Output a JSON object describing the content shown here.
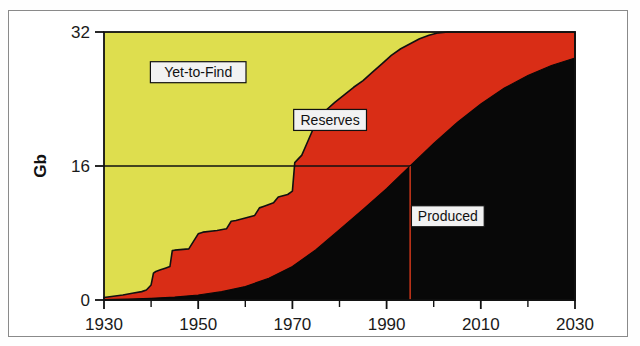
{
  "figure": {
    "background": "#ffffff",
    "frame_color": "#8a8a8a"
  },
  "chart_data": {
    "type": "area",
    "title": "",
    "subtitle": "",
    "xlabel": "",
    "ylabel": "Gb",
    "xlim": [
      1930,
      2030
    ],
    "ylim": [
      0,
      32
    ],
    "grid": false,
    "legend_position": "inline-annotations",
    "stacking": "cumulative-bands",
    "xticks": [
      1930,
      1950,
      1970,
      1990,
      2010,
      2030
    ],
    "xtick_labels": [
      "1930",
      "1950",
      "1970",
      "1990",
      "2010",
      "2030"
    ],
    "xminor_ticks": [
      1940,
      1960,
      1980,
      2000,
      2020
    ],
    "yticks": [
      0,
      16,
      32
    ],
    "ytick_labels": [
      "0",
      "16",
      "32"
    ],
    "series": [
      {
        "name": "Produced",
        "color": "#080808",
        "label": "Produced",
        "role": "cumulative-production",
        "x": [
          1930,
          1935,
          1940,
          1945,
          1950,
          1955,
          1960,
          1965,
          1970,
          1975,
          1980,
          1985,
          1990,
          1995,
          2000,
          2005,
          2010,
          2015,
          2020,
          2025,
          2030
        ],
        "values": [
          0.05,
          0.1,
          0.2,
          0.35,
          0.6,
          1.0,
          1.6,
          2.6,
          4.0,
          6.0,
          8.4,
          10.8,
          13.3,
          16.0,
          18.7,
          21.2,
          23.4,
          25.3,
          26.8,
          28.0,
          28.9
        ]
      },
      {
        "name": "Reserves",
        "color": "#d92d16",
        "label": "Reserves",
        "role": "discovered-minus-produced",
        "x": [
          1930,
          1935,
          1940,
          1945,
          1950,
          1955,
          1960,
          1965,
          1970,
          1975,
          1980,
          1985,
          1990,
          1995,
          2000,
          2005,
          2010,
          2015,
          2020,
          2025,
          2030
        ],
        "values": [
          0.25,
          0.8,
          1.6,
          5.6,
          7.3,
          7.6,
          8.2,
          9.6,
          12.4,
          15.2,
          15.2,
          14.6,
          13.9,
          13.0,
          11.9,
          10.8,
          9.6,
          8.1,
          6.4,
          4.6,
          3.1
        ]
      },
      {
        "name": "Yet-to-Find",
        "color": "#dede4e",
        "label": "Yet-to-Find",
        "role": "undiscovered-remaining",
        "x": [
          1930,
          1935,
          1940,
          1945,
          1950,
          1955,
          1960,
          1965,
          1970,
          1975,
          1980,
          1985,
          1990,
          1995,
          2000,
          2005,
          2010,
          2015,
          2020,
          2025,
          2030
        ],
        "values": [
          31.7,
          31.1,
          30.2,
          26.05,
          24.1,
          23.4,
          22.2,
          19.8,
          15.6,
          10.8,
          8.4,
          6.6,
          4.8,
          3.0,
          1.4,
          0.0,
          0.0,
          0.0,
          0.0,
          0.0,
          0.0
        ]
      }
    ],
    "discovery_curve": {
      "name": "Cumulative Discovery",
      "description": "Upper boundary of the red band: cumulative oil discovered",
      "points": [
        [
          1930,
          0.3
        ],
        [
          1932,
          0.45
        ],
        [
          1934,
          0.6
        ],
        [
          1936,
          0.8
        ],
        [
          1938,
          1.0
        ],
        [
          1939,
          1.2
        ],
        [
          1940,
          1.8
        ],
        [
          1940.5,
          3.2
        ],
        [
          1941,
          3.4
        ],
        [
          1942,
          3.6
        ],
        [
          1943,
          3.8
        ],
        [
          1944,
          4.0
        ],
        [
          1944.5,
          5.9
        ],
        [
          1945,
          5.95
        ],
        [
          1948,
          6.1
        ],
        [
          1950,
          7.9
        ],
        [
          1951,
          8.1
        ],
        [
          1954,
          8.3
        ],
        [
          1956,
          8.5
        ],
        [
          1957,
          9.4
        ],
        [
          1958,
          9.5
        ],
        [
          1960,
          9.8
        ],
        [
          1962,
          10.1
        ],
        [
          1963,
          11.0
        ],
        [
          1964,
          11.2
        ],
        [
          1966,
          11.6
        ],
        [
          1967,
          12.3
        ],
        [
          1969,
          12.6
        ],
        [
          1970,
          13.0
        ],
        [
          1970.5,
          16.4
        ],
        [
          1972,
          17.3
        ],
        [
          1973,
          18.6
        ],
        [
          1975,
          21.2
        ],
        [
          1977,
          22.6
        ],
        [
          1979,
          23.6
        ],
        [
          1981,
          24.5
        ],
        [
          1983,
          25.4
        ],
        [
          1985,
          26.2
        ],
        [
          1987,
          27.2
        ],
        [
          1989,
          28.2
        ],
        [
          1991,
          29.2
        ],
        [
          1993,
          30.0
        ],
        [
          1995,
          30.6
        ],
        [
          1997,
          31.2
        ],
        [
          1999,
          31.6
        ],
        [
          2001,
          31.9
        ],
        [
          2003,
          32.0
        ],
        [
          2030,
          32.0
        ]
      ]
    },
    "annotations": [
      {
        "name": "midpoint-marker-vertical",
        "type": "vline",
        "x": 1995,
        "color": "#c0341a",
        "y_from": 0,
        "y_to": 16
      },
      {
        "name": "midpoint-marker-horizontal",
        "type": "hline",
        "y": 16,
        "color": "#111111",
        "x_from": 1930,
        "x_to": 1995
      }
    ],
    "labels": [
      {
        "name": "yet-to-find-label",
        "text": "Yet-to-Find",
        "x": 1950,
        "y": 27.2
      },
      {
        "name": "reserves-label",
        "text": "Reserves",
        "x": 1978,
        "y": 21.5
      },
      {
        "name": "produced-label",
        "text": "Produced",
        "x": 2003,
        "y": 10.0
      }
    ]
  }
}
